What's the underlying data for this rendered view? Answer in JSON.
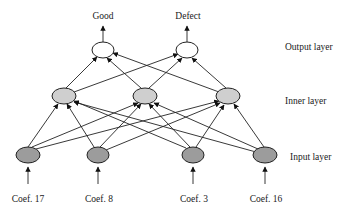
{
  "diagram": {
    "type": "neural-network",
    "layers": {
      "output": {
        "label": "Output layer",
        "nodes": [
          "Good",
          "Defect"
        ]
      },
      "inner": {
        "label": "Inner layer",
        "node_count": 3
      },
      "input": {
        "label": "Input layer",
        "nodes": [
          "Coef. 17",
          "Coef. 8",
          "Coef. 3",
          "Coef. 16"
        ]
      }
    },
    "outputs": [
      "Good",
      "Defect"
    ],
    "inputs": [
      "Coef. 17",
      "Coef. 8",
      "Coef. 3",
      "Coef. 16"
    ],
    "layer_labels": [
      "Output layer",
      "Inner layer",
      "Input layer"
    ],
    "connections": "fully connected: input→inner, inner→output",
    "colors": {
      "output_node": "#ffffff",
      "inner_node": "#cfcfcf",
      "input_node": "#9c9c9c",
      "stroke": "#222222"
    }
  }
}
